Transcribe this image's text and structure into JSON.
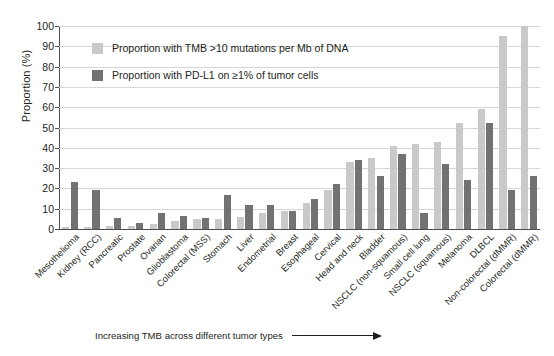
{
  "chart_data": {
    "type": "bar",
    "title": "",
    "xlabel": "Increasing TMB across different tumor types",
    "ylabel": "Proportion (%)",
    "ylim": [
      0,
      100
    ],
    "ytick_step": 10,
    "yticks": [
      "0",
      "10",
      "20",
      "30",
      "40",
      "50",
      "60",
      "70",
      "80",
      "90",
      "100"
    ],
    "grid": true,
    "legend_position": "upper-left-inside",
    "categories": [
      "Mesothelioma",
      "Kidney (RCC)",
      "Pancreatic",
      "Prostate",
      "Ovarian",
      "Glioblastoma",
      "Colorectal (MSS)",
      "Stomach",
      "Liver",
      "Endometrial",
      "Breast",
      "Esophageal",
      "Cervical",
      "Head and neck",
      "Bladder",
      "NSCLC (non-squamous)",
      "Small cell lung",
      "NSCLC (squamous)",
      "Melanoma",
      "DLBCL",
      "Non-colorectal (dMMR)",
      "Colorectal (dMMR)"
    ],
    "series": [
      {
        "name": "Proportion with TMB >10 mutations per Mb of DNA",
        "color": "#c9c9c9",
        "values": [
          1,
          1,
          1.5,
          1.5,
          2.5,
          4,
          5,
          5,
          6,
          8,
          9,
          13,
          19,
          33,
          35,
          41,
          42,
          43,
          52,
          59,
          95,
          100
        ]
      },
      {
        "name": "Proportion with PD-L1 on ≥1% of tumor cells",
        "color": "#727272",
        "values": [
          23,
          19,
          5.5,
          3,
          8,
          6.5,
          5.5,
          17,
          12,
          12,
          9,
          15,
          22,
          34,
          26,
          37,
          8,
          32,
          24,
          52,
          19,
          26
        ]
      }
    ]
  },
  "legend": {
    "items": [
      {
        "label": "Proportion with TMB >10 mutations per Mb of DNA",
        "color": "#c9c9c9"
      },
      {
        "label": "Proportion with PD-L1 on ≥1% of tumor cells",
        "color": "#727272"
      }
    ]
  },
  "axis": {
    "y_title": "Proportion (%)"
  },
  "caption": {
    "text": "Increasing TMB across different tumor types"
  }
}
